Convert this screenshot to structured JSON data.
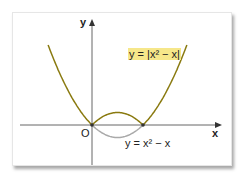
{
  "chart_data": {
    "type": "line",
    "title": "",
    "xlabel": "x",
    "ylabel": "y",
    "origin_label": "O",
    "series": [
      {
        "name": "y = |x² − x|",
        "expression": "|x^2 - x|",
        "color": "#8a7a10",
        "highlighted": true,
        "x": [
          -0.9,
          -0.5,
          0,
          0.25,
          0.5,
          0.75,
          1,
          1.5,
          1.9
        ],
        "values": [
          1.71,
          0.75,
          0,
          0.1875,
          0.25,
          0.1875,
          0,
          0.75,
          1.71
        ]
      },
      {
        "name": "y = x² − x",
        "expression": "x^2 - x",
        "color": "#aaaaaa",
        "x": [
          0,
          0.25,
          0.5,
          0.75,
          1
        ],
        "values": [
          0,
          -0.1875,
          -0.25,
          -0.1875,
          0
        ]
      }
    ],
    "grid": false,
    "annotations": [
      "y = |x² − x|",
      "y = x² − x"
    ]
  },
  "labels": {
    "y_axis": "y",
    "x_axis": "x",
    "origin": "O",
    "abs_curve": "y = |x² − x|",
    "parabola": "y = x² − x"
  },
  "colors": {
    "abs_curve": "#8a7a10",
    "parabola": "#aaaaaa",
    "highlight": "#f6e78a",
    "axis": "#555555"
  }
}
